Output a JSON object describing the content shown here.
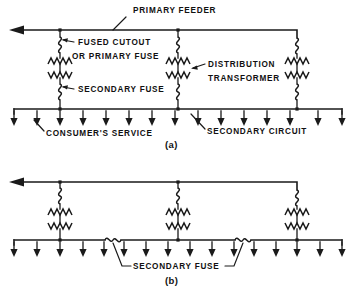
{
  "figure": {
    "panels": [
      {
        "id": "a",
        "caption": "(a)",
        "labels": {
          "primary_feeder": "PRIMARY FEEDER",
          "fused_cutout_line1": "FUSED CUTOUT",
          "fused_cutout_line2": "OR PRIMARY FUSE",
          "distribution_transformer_line1": "DISTRIBUTION",
          "distribution_transformer_line2": "TRANSFORMER",
          "secondary_fuse": "SECONDARY FUSE",
          "consumers_service": "CONSUMER'S SERVICE",
          "secondary_circuit": "SECONDARY CIRCUIT"
        },
        "transformer_count": 3,
        "transformer_x": [
          60,
          178,
          297
        ],
        "service_drop_count": 15,
        "has_primary_fuse": true,
        "has_secondary_fuse": true
      },
      {
        "id": "b",
        "caption": "(b)",
        "labels": {
          "secondary_fuse": "SECONDARY FUSE"
        },
        "transformer_count": 3,
        "transformer_x": [
          60,
          178,
          297
        ],
        "service_drop_count": 16,
        "has_primary_fuse": true,
        "secondary_fuse_count": 2,
        "secondary_fuse_x": [
          112,
          242
        ]
      }
    ],
    "colors": {
      "line": "#1a1a1a",
      "background": "#ffffff",
      "text": "#111111"
    }
  }
}
